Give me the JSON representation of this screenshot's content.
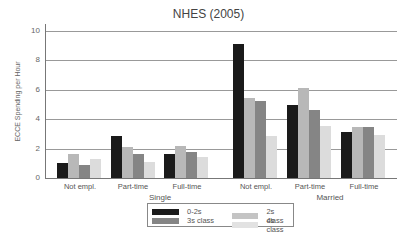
{
  "chart_data": {
    "type": "bar",
    "title": "NHES (2005)",
    "xlabel": "",
    "ylabel": "ECCE Spending per Hour",
    "ylim": [
      0,
      10
    ],
    "yticks": [
      0,
      2,
      4,
      6,
      8,
      10
    ],
    "grid": true,
    "legend_position": "bottom-center",
    "groups": [
      "Single",
      "Married"
    ],
    "categories": [
      "Not empl.",
      "Part-time",
      "Full-time",
      "Not empl.",
      "Part-time",
      "Full-time"
    ],
    "series": [
      {
        "name": "0-2s",
        "color": "#1a1a1a",
        "values": [
          1.0,
          2.85,
          1.65,
          9.1,
          4.95,
          3.1
        ]
      },
      {
        "name": "2s class",
        "color": "#b8b8b8",
        "values": [
          1.6,
          2.1,
          2.15,
          5.45,
          6.1,
          3.5
        ]
      },
      {
        "name": "3s class",
        "color": "#858585",
        "values": [
          0.9,
          1.6,
          1.75,
          5.25,
          4.6,
          3.45
        ]
      },
      {
        "name": "4s class",
        "color": "#dcdcdc",
        "values": [
          1.3,
          1.1,
          1.4,
          2.85,
          3.55,
          2.9
        ]
      }
    ]
  },
  "labels": {
    "title": "NHES (2005)",
    "ylabel": "ECCE Spending per Hour",
    "ticks": [
      "0",
      "2",
      "4",
      "6",
      "8",
      "10"
    ],
    "group_single": "Single",
    "group_married": "Married",
    "cats": [
      "Not empl.",
      "Part-time",
      "Full-time",
      "Not empl.",
      "Part-time",
      "Full-time"
    ],
    "legend": [
      "0-2s",
      "2s class",
      "3s class",
      "4s class"
    ]
  }
}
